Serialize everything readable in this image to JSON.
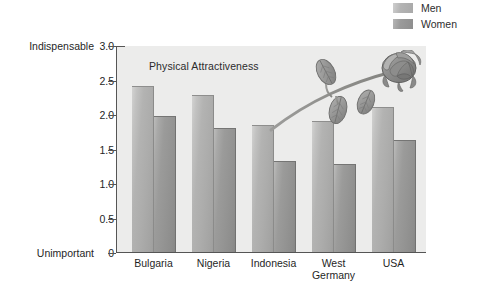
{
  "legend": {
    "position": "top-right",
    "items": [
      {
        "label": "Men",
        "swatch": "men",
        "color": "#b4b4b4"
      },
      {
        "label": "Women",
        "swatch": "women",
        "color": "#9a9a9a"
      }
    ]
  },
  "axis_captions": {
    "top": "Indispensable",
    "bottom": "Unimportant"
  },
  "decoration": {
    "name": "rose-illustration",
    "stem_color": "#9a9a98",
    "petal_color": "#8f8f8e",
    "leaf_color": "#989897"
  },
  "chart_data": {
    "type": "bar",
    "title": "Physical Attractiveness",
    "xlabel": "",
    "ylabel": "",
    "ylim": [
      0,
      3.0
    ],
    "yticks": [
      "0",
      "0.5",
      "1.0",
      "1.5",
      "2.0",
      "2.5",
      "3.0"
    ],
    "ytick_values": [
      0,
      0.5,
      1.0,
      1.5,
      2.0,
      2.5,
      3.0
    ],
    "y_axis_anchor_high": "Indispensable",
    "y_axis_anchor_low": "Unimportant",
    "grid": false,
    "legend_position": "top-right",
    "categories": [
      "Bulgaria",
      "Nigeria",
      "Indonesia",
      "West\nGermany",
      "USA"
    ],
    "series": [
      {
        "name": "Men",
        "values": [
          2.4,
          2.28,
          1.84,
          1.9,
          2.1
        ]
      },
      {
        "name": "Women",
        "values": [
          1.97,
          1.8,
          1.32,
          1.27,
          1.63
        ]
      }
    ]
  }
}
